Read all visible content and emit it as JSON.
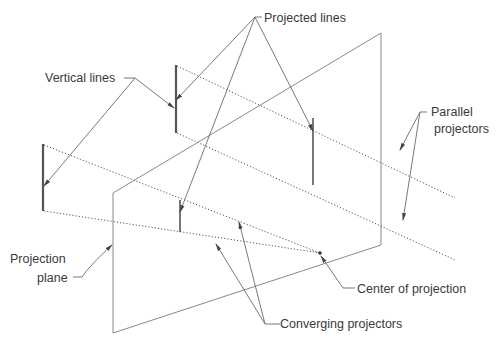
{
  "diagram": {
    "type": "projection-diagram",
    "labels": {
      "projected_lines": "Projected lines",
      "vertical_lines": "Vertical lines",
      "parallel_projectors_1": "Parallel",
      "parallel_projectors_2": "projectors",
      "projection_plane_1": "Projection",
      "projection_plane_2": "plane",
      "center_of_projection": "Center of projection",
      "converging_projectors": "Converging projectors"
    },
    "colors": {
      "line": "#7a7a7a",
      "object_line": "#555555",
      "text": "#3a3a3a",
      "background": "#ffffff"
    }
  }
}
